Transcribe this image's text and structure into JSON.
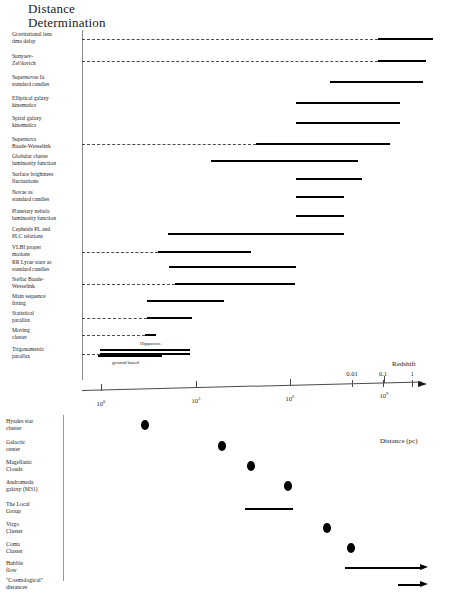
{
  "title": {
    "line1": "Distance",
    "line2": "Determination"
  },
  "upper_panel": {
    "methods": [
      {
        "label": "Gravitational lens\ntime delay",
        "y": 38,
        "dash": true,
        "bar_x1": 378,
        "bar_x2": 433
      },
      {
        "label": "Sunyaev-\nZel'dovich",
        "y": 60,
        "dash": true,
        "bar_x1": 378,
        "bar_x2": 426
      },
      {
        "label": "Supernovae Ia\nstandard candles",
        "y": 81,
        "dash": false,
        "bar_x1": 330,
        "bar_x2": 423
      },
      {
        "label": "Elliptical galaxy\nkinematics",
        "y": 102,
        "dash": false,
        "bar_x1": 296,
        "bar_x2": 400
      },
      {
        "label": "Spiral galaxy\nkinematics",
        "y": 122,
        "dash": false,
        "bar_x1": 296,
        "bar_x2": 400
      },
      {
        "label": "Supernova\nBaade-Wesselink",
        "y": 143,
        "dash": true,
        "bar_x1": 256,
        "bar_x2": 390
      },
      {
        "label": "Globular cluster\nluminosity function",
        "y": 160,
        "dash": false,
        "bar_x1": 211,
        "bar_x2": 358
      },
      {
        "label": "Surface brightness\nfluctuations",
        "y": 178,
        "dash": false,
        "bar_x1": 296,
        "bar_x2": 362
      },
      {
        "label": "Novae as\nstandard candles",
        "y": 196,
        "dash": false,
        "bar_x1": 296,
        "bar_x2": 344
      },
      {
        "label": "Planetary nebula\nluminosity function",
        "y": 215,
        "dash": false,
        "bar_x1": 296,
        "bar_x2": 344
      },
      {
        "label": "Cepheids PL and\nPLC relations",
        "y": 233,
        "dash": false,
        "bar_x1": 168,
        "bar_x2": 344
      },
      {
        "label": "VLBI proper\nmotions",
        "y": 251,
        "dash": true,
        "bar_x1": 158,
        "bar_x2": 251
      },
      {
        "label": "RR Lyrae stars as\nstandard candles",
        "y": 266,
        "dash": false,
        "bar_x1": 169,
        "bar_x2": 296
      },
      {
        "label": "Stellar Baade-\nWesselink",
        "y": 283,
        "dash": true,
        "bar_x1": 175,
        "bar_x2": 295
      },
      {
        "label": "Main sequence\nfitting",
        "y": 300,
        "dash": false,
        "bar_x1": 147,
        "bar_x2": 224
      },
      {
        "label": "Statistical\nparallax",
        "y": 317,
        "dash": true,
        "bar_x1": 147,
        "bar_x2": 192
      },
      {
        "label": "Moving\ncluster",
        "y": 334,
        "dash": true,
        "bar_x1": 145,
        "bar_x2": 156
      },
      {
        "label": "Trigonometric\nparallax",
        "y": 353,
        "dash": true,
        "bar_x1": 100,
        "bar_x2": 190
      }
    ],
    "sub_bars": [
      {
        "label": "Hipparcos",
        "label_x": 140,
        "label_y": 341,
        "bar_x1": 100,
        "bar_x2": 190,
        "bar_y": 349
      },
      {
        "label": "ground based",
        "label_x": 112,
        "label_y": 360,
        "bar_x1": 98,
        "bar_x2": 162,
        "bar_y": 355
      }
    ]
  },
  "redshift_axis": {
    "title": "Redshift",
    "ticks": [
      {
        "label": "0.01",
        "x": 352
      },
      {
        "label": "0.1",
        "x": 383
      },
      {
        "label": "1",
        "x": 412
      }
    ]
  },
  "distance_axis": {
    "title": "Distance (pc)",
    "ticks": [
      {
        "mantissa": "10",
        "exponent": "0",
        "x": 101
      },
      {
        "mantissa": "10",
        "exponent": "3",
        "x": 196
      },
      {
        "mantissa": "10",
        "exponent": "6",
        "x": 290
      },
      {
        "mantissa": "10",
        "exponent": "9",
        "x": 384
      }
    ]
  },
  "lower_panel": {
    "objects": [
      {
        "label": "Hyades star\ncluster",
        "y": 425,
        "marker": "dot",
        "x": 145
      },
      {
        "label": "Galactic\ncenter",
        "y": 446,
        "marker": "dot",
        "x": 222
      },
      {
        "label": "Magellanic\nClouds",
        "y": 466,
        "marker": "dot",
        "x": 251
      },
      {
        "label": "Andromeda\ngalaxy (M31)",
        "y": 486,
        "marker": "dot",
        "x": 288
      },
      {
        "label": "The Local\nGroup",
        "y": 508,
        "marker": "bar",
        "x1": 245,
        "x2": 293
      },
      {
        "label": "Virgo\nCluster",
        "y": 528,
        "marker": "dot",
        "x": 327
      },
      {
        "label": "Coma\nCluster",
        "y": 548,
        "marker": "dot",
        "x": 351
      },
      {
        "label": "Hubble\nflow",
        "y": 567,
        "marker": "arrow",
        "x1": 345,
        "x2": 420
      },
      {
        "label": "\"Cosmological\"\ndistances",
        "y": 584,
        "marker": "arrow",
        "x1": 398,
        "x2": 420
      }
    ]
  }
}
